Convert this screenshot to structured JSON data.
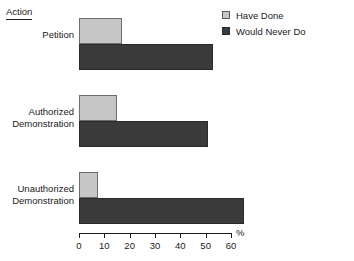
{
  "axis_title": "Action",
  "legend": {
    "position": "top-right",
    "items": [
      {
        "label": "Have Done",
        "color": "#c6c6c6",
        "swatch": "light-square-swatch"
      },
      {
        "label": "Would Never Do",
        "color": "#3a3a3a",
        "swatch": "dark-square-swatch"
      }
    ]
  },
  "xaxis": {
    "unit_label": "%",
    "ticks": [
      "0",
      "10",
      "20",
      "30",
      "40",
      "50",
      "60"
    ],
    "min": 0,
    "max": 60
  },
  "categories": [
    {
      "line1": "Petition",
      "line2": ""
    },
    {
      "line1": "Authorized",
      "line2": "Demonstration"
    },
    {
      "line1": "Unauthorized",
      "line2": "Demonstration"
    }
  ],
  "chart_data": {
    "type": "bar",
    "orientation": "horizontal",
    "title": "Action",
    "xlabel": "%",
    "ylabel": "Action",
    "xlim": [
      0,
      60
    ],
    "xticks": [
      0,
      10,
      20,
      30,
      40,
      50,
      60
    ],
    "grid": false,
    "legend_position": "top-right",
    "categories": [
      "Petition",
      "Authorized Demonstration",
      "Unauthorized Demonstration"
    ],
    "series": [
      {
        "name": "Have Done",
        "color": "#c6c6c6",
        "values": [
          17,
          15,
          7.5
        ]
      },
      {
        "name": "Would Never Do",
        "color": "#3a3a3a",
        "values": [
          53,
          51,
          65
        ]
      }
    ]
  }
}
